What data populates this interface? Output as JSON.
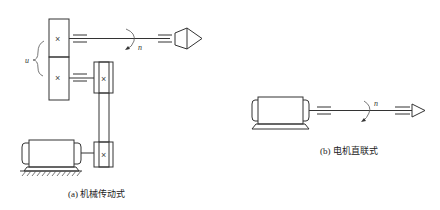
{
  "diagram": {
    "panel_a": {
      "caption": "(a) 机械传动式",
      "bracket_label": "u",
      "speed_label": "n",
      "gear_mark_top": "×",
      "gear_mark_bottom": "×",
      "pulley_mark_top": "×",
      "pulley_mark_bottom": "×"
    },
    "panel_b": {
      "caption": "(b) 电机直联式",
      "speed_label": "n"
    }
  }
}
